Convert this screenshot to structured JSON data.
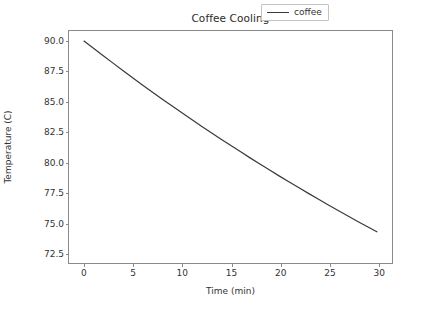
{
  "chart_data": {
    "type": "line",
    "title": "Coffee Cooling",
    "xlabel": "Time (min)",
    "ylabel": "Temperature (C)",
    "xlim": [
      -1.5,
      31.5
    ],
    "ylim": [
      71.6,
      90.8
    ],
    "grid": false,
    "legend_position": "upper right",
    "xticks": [
      0,
      5,
      10,
      15,
      20,
      25,
      30
    ],
    "xtick_labels": [
      "0",
      "5",
      "10",
      "15",
      "20",
      "25",
      "30"
    ],
    "yticks": [
      72.5,
      75.0,
      77.5,
      80.0,
      82.5,
      85.0,
      87.5,
      90.0
    ],
    "ytick_labels": [
      "72.5",
      "75.0",
      "77.5",
      "80.0",
      "82.5",
      "85.0",
      "87.5",
      "90.0"
    ],
    "series": [
      {
        "name": "coffee",
        "color": "#3a3a3a",
        "linewidth": 1.2,
        "x": [
          0,
          1,
          2,
          3,
          4,
          5,
          6,
          7,
          8,
          9,
          10,
          11,
          12,
          13,
          14,
          15,
          16,
          17,
          18,
          19,
          20,
          21,
          22,
          23,
          24,
          25,
          26,
          27,
          28,
          29,
          30
        ],
        "y": [
          90.0,
          89.37,
          88.75,
          88.14,
          87.53,
          86.93,
          86.34,
          85.76,
          85.18,
          84.61,
          84.05,
          83.49,
          82.94,
          82.4,
          81.87,
          81.34,
          80.82,
          80.3,
          79.79,
          79.29,
          78.79,
          78.3,
          77.82,
          77.34,
          76.87,
          76.4,
          75.94,
          75.49,
          75.04,
          74.6,
          74.16
        ]
      }
    ]
  },
  "legend": {
    "entries": [
      {
        "label": "coffee",
        "color": "#3a3a3a"
      }
    ]
  },
  "colors": {
    "line": "#3a3a3a",
    "axis": "#8a8a8a",
    "text": "#333333",
    "background": "#ffffff"
  }
}
